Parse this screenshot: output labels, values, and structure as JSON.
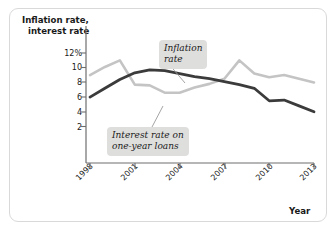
{
  "chart_data": {
    "type": "line",
    "title": "",
    "xlabel": "Year",
    "ylabel": "Inflation rate, interest rate",
    "ylabel_line1": "Inflation rate,",
    "ylabel_line2": "interest rate",
    "x": [
      1998,
      1999,
      2000,
      2001,
      2002,
      2003,
      2004,
      2005,
      2006,
      2007,
      2008,
      2009,
      2010,
      2011,
      2012,
      2013
    ],
    "xlim": [
      1998,
      2013
    ],
    "ylim": [
      0,
      13
    ],
    "xticks": [
      1998,
      2001,
      2004,
      2007,
      2010,
      2013
    ],
    "xtick_labels": [
      "1998",
      "2001",
      "2004",
      "2007",
      "2010",
      "2013"
    ],
    "yticks": [
      2,
      4,
      6,
      8,
      10,
      12
    ],
    "ytick_labels": [
      "2",
      "4",
      "6",
      "8",
      "10",
      "12%"
    ],
    "grid": false,
    "legend_position": "inline-callouts",
    "series": [
      {
        "name": "Inflation rate",
        "color": "#c4c4c4",
        "values": [
          9.0,
          10.1,
          11.0,
          7.7,
          7.6,
          6.6,
          6.6,
          7.3,
          7.8,
          8.5,
          11.0,
          9.2,
          8.7,
          9.0,
          8.5,
          8.0
        ]
      },
      {
        "name": "Interest rate on one-year loans",
        "color": "#3b3b3b",
        "values": [
          6.0,
          7.2,
          8.4,
          9.3,
          9.7,
          9.6,
          9.2,
          8.8,
          8.5,
          8.1,
          7.7,
          7.2,
          5.5,
          5.6,
          4.8,
          4.0
        ]
      }
    ],
    "annotations": [
      {
        "name": "inflation-callout",
        "line1": "Inflation",
        "line2": "rate",
        "points_to_series": "Inflation rate"
      },
      {
        "name": "interest-callout",
        "line1": "Interest rate on",
        "line2": "one-year loans",
        "points_to_series": "Interest rate on one-year loans"
      }
    ],
    "colors": {
      "inflation_line": "#c4c4c4",
      "interest_line": "#3b3b3b",
      "axis": "#6e6e6e",
      "callout_bg": "#dededd",
      "panel_border": "#d9d9d9",
      "text": "#1a1a1a"
    }
  }
}
